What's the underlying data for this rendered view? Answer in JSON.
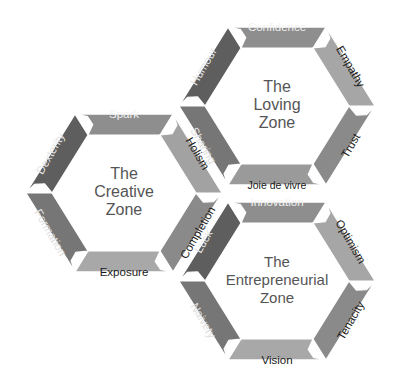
{
  "diagram": {
    "title": "",
    "zones": [
      {
        "id": "loving",
        "title_lines": [
          "The",
          "Loving",
          "Zone"
        ],
        "center": [
          277,
          106
        ],
        "segments": [
          {
            "label": "Confidence",
            "position": "top",
            "color": "#8e8e8e",
            "text_color": "#f2f2f2"
          },
          {
            "label": "Empathy",
            "position": "upper-right",
            "color": "#a6a6a6",
            "text_color": "#222222"
          },
          {
            "label": "Trust",
            "position": "lower-right",
            "color": "#8a8a8a",
            "text_color": "#222222"
          },
          {
            "label": "Joie de vivre",
            "position": "bottom",
            "color": "#9a9a9a",
            "text_color": "#1a1a1a"
          },
          {
            "label": "Sharing",
            "position": "lower-left",
            "color": "#767676",
            "text_color": "#e0e0e0"
          },
          {
            "label": "Humour",
            "position": "upper-left",
            "color": "#5e5e5e",
            "text_color": "#e6e6e6"
          }
        ]
      },
      {
        "id": "creative",
        "title_lines": [
          "The",
          "Creative",
          "Zone"
        ],
        "center": [
          124,
          193
        ],
        "segments": [
          {
            "label": "Spark",
            "position": "top",
            "color": "#8e8e8e",
            "text_color": "#f2f2f2"
          },
          {
            "label": "Holism",
            "position": "upper-right",
            "color": "#a2a2a2",
            "text_color": "#222222"
          },
          {
            "label": "Completion",
            "position": "lower-right",
            "color": "#8a8a8a",
            "text_color": "#222222"
          },
          {
            "label": "Exposure",
            "position": "bottom",
            "color": "#a8a8a8",
            "text_color": "#1a1a1a"
          },
          {
            "label": "Formation",
            "position": "lower-left",
            "color": "#767676",
            "text_color": "#e0e0e0"
          },
          {
            "label": "Dexterity",
            "position": "upper-left",
            "color": "#5e5e5e",
            "text_color": "#e6e6e6"
          }
        ]
      },
      {
        "id": "entrepreneurial",
        "title_lines": [
          "The",
          "Entrepreneurial",
          "Zone"
        ],
        "center": [
          277,
          281
        ],
        "segments": [
          {
            "label": "Innovation",
            "position": "top",
            "color": "#8e8e8e",
            "text_color": "#f2f2f2"
          },
          {
            "label": "Optimism",
            "position": "upper-right",
            "color": "#a6a6a6",
            "text_color": "#222222"
          },
          {
            "label": "Tenacity",
            "position": "lower-right",
            "color": "#8a8a8a",
            "text_color": "#222222"
          },
          {
            "label": "Vision",
            "position": "bottom",
            "color": "#a8a8a8",
            "text_color": "#1a1a1a"
          },
          {
            "label": "Naivety",
            "position": "lower-left",
            "color": "#767676",
            "text_color": "#e0e0e0"
          },
          {
            "label": "Luck",
            "position": "upper-left",
            "color": "#5e5e5e",
            "text_color": "#e6e6e6"
          }
        ]
      }
    ],
    "colors": {
      "background": "#ffffff",
      "title_text": "#555555",
      "divider": "#ffffff"
    }
  }
}
